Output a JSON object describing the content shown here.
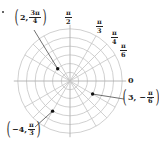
{
  "diagram": {
    "type": "polar-grid",
    "center": [
      70,
      81
    ],
    "unit_px": 8.7,
    "num_circles": 6,
    "ray_angles_deg": [
      0,
      30,
      45,
      60,
      90,
      120,
      135,
      150,
      180,
      210,
      225,
      240,
      270,
      300,
      315,
      330
    ],
    "colors": {
      "grid": "#c4c4c4",
      "point": "#111111",
      "text": "#222222"
    }
  },
  "angle_labels": [
    {
      "id": "pi-over-2",
      "num": "π",
      "den": "2",
      "x": 65,
      "y": 10
    },
    {
      "id": "pi-over-3",
      "num": "π",
      "den": "3",
      "x": 96,
      "y": 19
    },
    {
      "id": "pi-over-4",
      "num": "π",
      "den": "4",
      "x": 111,
      "y": 30
    },
    {
      "id": "pi-over-6",
      "num": "π",
      "den": "6",
      "x": 120,
      "y": 43
    }
  ],
  "zero_label": {
    "text": "0",
    "x": 128,
    "y": 75
  },
  "points": [
    {
      "id": "point-2-3pi-4",
      "r": 2,
      "theta_deg": 135,
      "label": {
        "prefix": "2, ",
        "num": "3π",
        "den": "4",
        "x": 13,
        "y": 8
      },
      "leader_from": [
        34,
        30
      ]
    },
    {
      "id": "point-3-neg-pi-6",
      "r": 3,
      "theta_deg": -30,
      "label": {
        "prefix": "3, −",
        "num": "π",
        "den": "6",
        "x": 121,
        "y": 88
      },
      "leader_from": [
        124,
        99
      ]
    },
    {
      "id": "point-neg4-pi-3",
      "r": -4,
      "theta_deg": 60,
      "label": {
        "prefix": "−4, ",
        "num": "π",
        "den": "3",
        "x": 5,
        "y": 120
      },
      "leader_from": [
        35,
        127
      ]
    }
  ]
}
